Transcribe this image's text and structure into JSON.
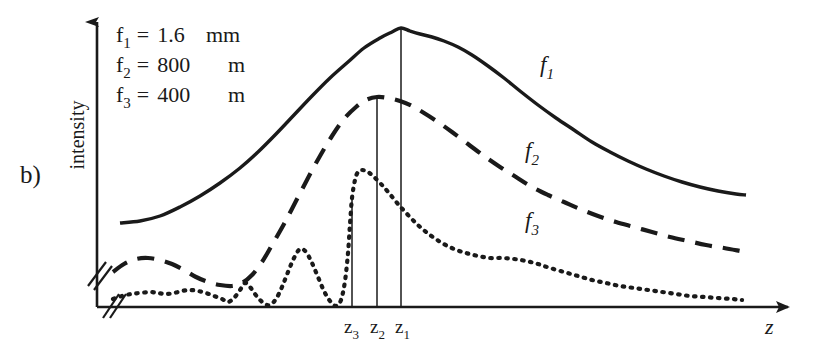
{
  "panel": {
    "label": "b)"
  },
  "axes": {
    "y_title": "intensity",
    "x_title": "z",
    "x_axis_y": 307,
    "y_axis_x": 97,
    "x_axis_start": 97,
    "x_axis_end": 800,
    "y_axis_top": 14,
    "break_marker": "double-slash"
  },
  "colors": {
    "ink": "#1a1a1a",
    "background": "#ffffff"
  },
  "legend": {
    "lines": [
      {
        "symbol": "f",
        "sub": "1",
        "eq": "=",
        "value": "1.6",
        "unit": "mm"
      },
      {
        "symbol": "f",
        "sub": "2",
        "eq": "=",
        "value": "800",
        "unit": "m"
      },
      {
        "symbol": "f",
        "sub": "3",
        "eq": "=",
        "value": "400",
        "unit": "m"
      }
    ]
  },
  "curve_labels": [
    {
      "symbol": "f",
      "sub": "1",
      "x": 540,
      "y": 72
    },
    {
      "symbol": "f",
      "sub": "2",
      "x": 525,
      "y": 158
    },
    {
      "symbol": "f",
      "sub": "3",
      "x": 525,
      "y": 228
    }
  ],
  "ticks": [
    {
      "symbol": "z",
      "sub": "3",
      "x": 352,
      "label_x": 344,
      "label_y": 333
    },
    {
      "symbol": "z",
      "sub": "2",
      "x": 377,
      "label_x": 370,
      "label_y": 333
    },
    {
      "symbol": "z",
      "sub": "1",
      "x": 401,
      "label_x": 395,
      "label_y": 333
    }
  ],
  "chart_data": {
    "type": "line",
    "title": "",
    "xlabel": "z",
    "ylabel": "intensity",
    "grid": false,
    "legend_position": "top-left",
    "axis_note": "both axes broken near origin; y increases upward",
    "xlim": [
      97,
      800
    ],
    "ylim_pixels": [
      307,
      14
    ],
    "series": [
      {
        "name": "f1",
        "label": "f₁",
        "style": "solid",
        "focal_length": "1.6 mm",
        "peak_x": 401,
        "points": [
          [
            120,
            223
          ],
          [
            140,
            221
          ],
          [
            160,
            216
          ],
          [
            180,
            207
          ],
          [
            200,
            196
          ],
          [
            220,
            183
          ],
          [
            240,
            168
          ],
          [
            258,
            152
          ],
          [
            276,
            134
          ],
          [
            294,
            115
          ],
          [
            312,
            96
          ],
          [
            330,
            78
          ],
          [
            348,
            62
          ],
          [
            364,
            48
          ],
          [
            380,
            38
          ],
          [
            392,
            32
          ],
          [
            401,
            28
          ],
          [
            410,
            31
          ],
          [
            420,
            34
          ],
          [
            432,
            37
          ],
          [
            444,
            41
          ],
          [
            458,
            47
          ],
          [
            472,
            55
          ],
          [
            488,
            66
          ],
          [
            504,
            78
          ],
          [
            520,
            91
          ],
          [
            538,
            105
          ],
          [
            556,
            118
          ],
          [
            574,
            130
          ],
          [
            592,
            142
          ],
          [
            610,
            152
          ],
          [
            628,
            161
          ],
          [
            646,
            169
          ],
          [
            664,
            176
          ],
          [
            682,
            182
          ],
          [
            700,
            187
          ],
          [
            718,
            191
          ],
          [
            736,
            194
          ],
          [
            746,
            195
          ]
        ]
      },
      {
        "name": "f2",
        "label": "f₂",
        "style": "dashed",
        "focal_length": "800 µm",
        "peak_x": 377,
        "points": [
          [
            113,
            272
          ],
          [
            124,
            264
          ],
          [
            136,
            259
          ],
          [
            148,
            258
          ],
          [
            160,
            260
          ],
          [
            172,
            264
          ],
          [
            184,
            270
          ],
          [
            196,
            277
          ],
          [
            208,
            282
          ],
          [
            220,
            285
          ],
          [
            232,
            286
          ],
          [
            242,
            283
          ],
          [
            252,
            275
          ],
          [
            262,
            262
          ],
          [
            272,
            245
          ],
          [
            284,
            224
          ],
          [
            296,
            201
          ],
          [
            308,
            178
          ],
          [
            320,
            156
          ],
          [
            332,
            136
          ],
          [
            344,
            119
          ],
          [
            356,
            107
          ],
          [
            366,
            100
          ],
          [
            377,
            97
          ],
          [
            388,
            98
          ],
          [
            400,
            101
          ],
          [
            412,
            106
          ],
          [
            424,
            113
          ],
          [
            438,
            122
          ],
          [
            452,
            132
          ],
          [
            468,
            144
          ],
          [
            484,
            156
          ],
          [
            500,
            167
          ],
          [
            516,
            177
          ],
          [
            532,
            187
          ],
          [
            548,
            195
          ],
          [
            564,
            202
          ],
          [
            580,
            209
          ],
          [
            598,
            216
          ],
          [
            616,
            222
          ],
          [
            634,
            227
          ],
          [
            652,
            232
          ],
          [
            670,
            237
          ],
          [
            688,
            241
          ],
          [
            706,
            245
          ],
          [
            724,
            248
          ],
          [
            740,
            251
          ]
        ]
      },
      {
        "name": "f3",
        "label": "f₃",
        "style": "dotted",
        "focal_length": "400 µm",
        "peak_x": 352,
        "points": [
          [
            113,
            299
          ],
          [
            122,
            296
          ],
          [
            131,
            294
          ],
          [
            140,
            293
          ],
          [
            150,
            292
          ],
          [
            158,
            293
          ],
          [
            166,
            294
          ],
          [
            174,
            293
          ],
          [
            182,
            291
          ],
          [
            190,
            290
          ],
          [
            198,
            291
          ],
          [
            206,
            293
          ],
          [
            214,
            296
          ],
          [
            222,
            299
          ],
          [
            228,
            302
          ],
          [
            234,
            298
          ],
          [
            240,
            290
          ],
          [
            245,
            283
          ],
          [
            250,
            287
          ],
          [
            255,
            294
          ],
          [
            260,
            300
          ],
          [
            265,
            304
          ],
          [
            270,
            305
          ],
          [
            276,
            299
          ],
          [
            282,
            287
          ],
          [
            288,
            272
          ],
          [
            294,
            258
          ],
          [
            300,
            249
          ],
          [
            306,
            252
          ],
          [
            312,
            263
          ],
          [
            318,
            277
          ],
          [
            324,
            291
          ],
          [
            330,
            301
          ],
          [
            336,
            306
          ],
          [
            341,
            300
          ],
          [
            345,
            281
          ],
          [
            348,
            253
          ],
          [
            350,
            224
          ],
          [
            352,
            198
          ],
          [
            355,
            180
          ],
          [
            358,
            172
          ],
          [
            362,
            170
          ],
          [
            368,
            172
          ],
          [
            374,
            177
          ],
          [
            381,
            184
          ],
          [
            389,
            193
          ],
          [
            398,
            204
          ],
          [
            408,
            215
          ],
          [
            419,
            226
          ],
          [
            430,
            235
          ],
          [
            442,
            243
          ],
          [
            454,
            249
          ],
          [
            466,
            253
          ],
          [
            478,
            256
          ],
          [
            490,
            258
          ],
          [
            502,
            258
          ],
          [
            514,
            259
          ],
          [
            526,
            261
          ],
          [
            538,
            264
          ],
          [
            550,
            268
          ],
          [
            564,
            272
          ],
          [
            578,
            276
          ],
          [
            592,
            280
          ],
          [
            606,
            283
          ],
          [
            620,
            286
          ],
          [
            634,
            288
          ],
          [
            648,
            290
          ],
          [
            662,
            292
          ],
          [
            676,
            294
          ],
          [
            690,
            296
          ],
          [
            704,
            297
          ],
          [
            718,
            298
          ],
          [
            732,
            299
          ],
          [
            742,
            300
          ]
        ]
      }
    ],
    "drop_lines": [
      {
        "name": "z3",
        "x": 352,
        "y_top": 198,
        "y_bottom": 307
      },
      {
        "name": "z2",
        "x": 377,
        "y_top": 97,
        "y_bottom": 307
      },
      {
        "name": "z1",
        "x": 401,
        "y_top": 28,
        "y_bottom": 307
      }
    ]
  }
}
